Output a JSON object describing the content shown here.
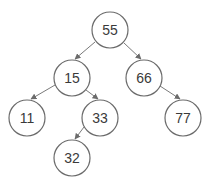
{
  "diagram": {
    "type": "binary-search-tree",
    "colors": {
      "background": "#ffffff",
      "node_stroke": "#6b6b6b",
      "node_fill": "#ffffff",
      "edge": "#7a7a7a",
      "text": "#3a3a3a"
    },
    "node_radius": 18,
    "nodes": [
      {
        "id": "n55",
        "label": "55",
        "cx": 110,
        "cy": 30
      },
      {
        "id": "n15",
        "label": "15",
        "cx": 72,
        "cy": 78
      },
      {
        "id": "n66",
        "label": "66",
        "cx": 144,
        "cy": 78
      },
      {
        "id": "n11",
        "label": "11",
        "cx": 27,
        "cy": 118
      },
      {
        "id": "n33",
        "label": "33",
        "cx": 100,
        "cy": 118
      },
      {
        "id": "n77",
        "label": "77",
        "cx": 183,
        "cy": 118
      },
      {
        "id": "n32",
        "label": "32",
        "cx": 72,
        "cy": 158
      }
    ],
    "edges": [
      {
        "from": "n55",
        "to": "n15",
        "x1": 95,
        "y1": 42,
        "x2": 75,
        "y2": 59
      },
      {
        "from": "n55",
        "to": "n66",
        "x1": 124,
        "y1": 43,
        "x2": 141,
        "y2": 59
      },
      {
        "from": "n15",
        "to": "n11",
        "x1": 55,
        "y1": 85,
        "x2": 31,
        "y2": 99
      },
      {
        "from": "n15",
        "to": "n33",
        "x1": 86,
        "y1": 90,
        "x2": 98,
        "y2": 99
      },
      {
        "from": "n66",
        "to": "n77",
        "x1": 160,
        "y1": 86,
        "x2": 180,
        "y2": 99
      },
      {
        "from": "n33",
        "to": "n32",
        "x1": 84,
        "y1": 127,
        "x2": 75,
        "y2": 139
      }
    ]
  }
}
